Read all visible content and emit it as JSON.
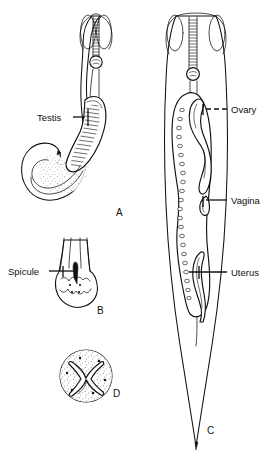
{
  "figure": {
    "background_color": "#ffffff",
    "ink_color": "#111111"
  },
  "labels": [
    {
      "id": "testis",
      "text": "Testis",
      "x": 37,
      "y": 121,
      "anchor": "start"
    },
    {
      "id": "spicule",
      "text": "Spicule",
      "x": 8,
      "y": 275,
      "anchor": "start"
    },
    {
      "id": "ovary",
      "text": "Ovary",
      "x": 231,
      "y": 113,
      "anchor": "start"
    },
    {
      "id": "vagina",
      "text": "Vagina",
      "x": 231,
      "y": 204,
      "anchor": "start"
    },
    {
      "id": "uterus",
      "text": "Uterus",
      "x": 231,
      "y": 276,
      "anchor": "start"
    }
  ],
  "panels": [
    {
      "id": "a",
      "letter": "A",
      "x": 116,
      "y": 216,
      "caption": "Male whole worm with testis and hooked tail"
    },
    {
      "id": "b",
      "letter": "B",
      "x": 97,
      "y": 314,
      "caption": "Male posterior end with spicule"
    },
    {
      "id": "c",
      "letter": "C",
      "x": 207,
      "y": 434,
      "caption": "Female whole worm with ovary, vagina and uterus"
    },
    {
      "id": "d",
      "letter": "D",
      "x": 113,
      "y": 397,
      "caption": "Cross section of worm"
    }
  ]
}
